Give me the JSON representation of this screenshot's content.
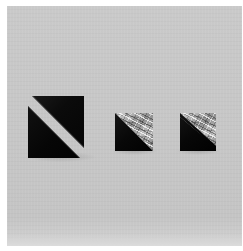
{
  "image": {
    "kind": "photograph",
    "subject": "Three geometric forms mounted on a light gray panel",
    "caption": "Three dark triangular forms on a pale gray ground; the left form is a black square split along its diagonal into two offset triangles, the middle and right forms pair a solid black triangle with a crumpled metallic foil triangle.",
    "orientation": "portrait",
    "background_label": "light gray panel",
    "border_label": "white margin"
  },
  "palette": {
    "panel_gray": "#c7c7c7",
    "panel_gray_light": "#d4d4d4",
    "panel_bottom_edge": "#dadada",
    "frame_white": "#ffffff",
    "form_black": "#080808",
    "form_black_highlight": "#1a1a1a",
    "foil_mid": "#9a9a9a",
    "foil_light": "#d5d5d5",
    "foil_dark": "#7c7c7c"
  },
  "forms": [
    {
      "id": "shape-1",
      "name": "split-black-square",
      "order": 1,
      "position": "left",
      "description": "Black square divided along its diagonal into two triangles that are slid apart, leaving a pale diagonal band of exposed panel between them.",
      "surface": "matte black",
      "parts": [
        {
          "name": "upper-right-triangle",
          "surface": "matte black",
          "shift": "up and right"
        },
        {
          "name": "lower-left-triangle",
          "surface": "matte black",
          "shift": "down and left"
        },
        {
          "name": "diagonal-gap",
          "surface": "exposed gray panel"
        }
      ],
      "approx_size_px": "62 x 61"
    },
    {
      "id": "shape-2",
      "name": "black-and-foil-square-medium",
      "order": 2,
      "position": "center",
      "description": "Square split corner to corner: solid black lower-left triangle beside a crumpled reflective foil upper-right triangle.",
      "parts": [
        {
          "name": "lower-left-triangle",
          "surface": "matte black"
        },
        {
          "name": "upper-right-triangle",
          "surface": "crumpled metallic foil"
        }
      ],
      "approx_size_px": "38 x 38"
    },
    {
      "id": "shape-3",
      "name": "black-and-foil-square-right",
      "order": 3,
      "position": "right",
      "description": "Square with a shallower diagonal: a larger solid black triangle below a narrower band of crumpled reflective foil at the top right.",
      "parts": [
        {
          "name": "lower-left-triangle",
          "surface": "matte black"
        },
        {
          "name": "upper-right-triangle",
          "surface": "crumpled metallic foil"
        }
      ],
      "approx_size_px": "36 x 38"
    }
  ]
}
